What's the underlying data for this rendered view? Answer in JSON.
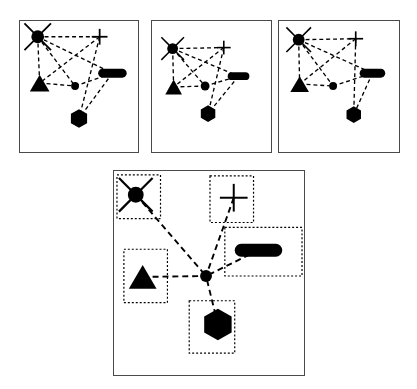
{
  "figure": {
    "background_color": "#ffffff",
    "ink_color": "#000000",
    "panel_border_color": "#4a4a4a",
    "edge_style": "dashed",
    "bbox_style": "dotted"
  },
  "legend": {
    "node_types": [
      {
        "key": "starburst",
        "label": "starburst",
        "icon": "starburst-icon"
      },
      {
        "key": "plus",
        "label": "plus",
        "icon": "plus-icon"
      },
      {
        "key": "pill",
        "label": "pill",
        "icon": "pill-icon"
      },
      {
        "key": "triangle",
        "label": "triangle",
        "icon": "triangle-icon"
      },
      {
        "key": "hexagon",
        "label": "hexagon",
        "icon": "hexagon-icon"
      },
      {
        "key": "dot",
        "label": "dot",
        "icon": "dot-icon"
      }
    ]
  },
  "panels": [
    {
      "id": "panel-1",
      "label": "Panel 1",
      "rect": {
        "x": 19,
        "y": 20,
        "w": 120,
        "h": 133
      },
      "viewbox": {
        "w": 120,
        "h": 133
      },
      "show_bboxes": false,
      "nodes": [
        {
          "id": "starburst",
          "shape": "starburst",
          "x": 18,
          "y": 16,
          "r": 6.5,
          "spike": 7
        },
        {
          "id": "plus",
          "shape": "plus",
          "x": 81,
          "y": 16,
          "r": 8,
          "thick": 1.8
        },
        {
          "id": "pill",
          "shape": "pill",
          "x": 94,
          "y": 53,
          "w": 29,
          "h": 9
        },
        {
          "id": "triangle",
          "shape": "triangle",
          "x": 20,
          "y": 63,
          "w": 20,
          "h": 17
        },
        {
          "id": "dot",
          "shape": "dot",
          "x": 56,
          "y": 66,
          "r": 4
        },
        {
          "id": "hexagon",
          "shape": "hexagon",
          "x": 60,
          "y": 99,
          "r": 9.5
        }
      ],
      "edges": [
        [
          "starburst",
          "plus"
        ],
        [
          "starburst",
          "triangle"
        ],
        [
          "starburst",
          "pill"
        ],
        [
          "starburst",
          "dot"
        ],
        [
          "plus",
          "triangle"
        ],
        [
          "plus",
          "hexagon"
        ],
        [
          "triangle",
          "dot"
        ],
        [
          "dot",
          "pill"
        ],
        [
          "pill",
          "hexagon"
        ]
      ]
    },
    {
      "id": "panel-2",
      "label": "Panel 2",
      "rect": {
        "x": 151,
        "y": 20,
        "w": 121,
        "h": 133
      },
      "viewbox": {
        "w": 121,
        "h": 133
      },
      "show_bboxes": false,
      "nodes": [
        {
          "id": "starburst",
          "shape": "starburst",
          "x": 21,
          "y": 28,
          "r": 5.5,
          "spike": 6
        },
        {
          "id": "plus",
          "shape": "plus",
          "x": 73,
          "y": 27,
          "r": 7,
          "thick": 1.6
        },
        {
          "id": "pill",
          "shape": "pill",
          "x": 88,
          "y": 56,
          "w": 22,
          "h": 8
        },
        {
          "id": "triangle",
          "shape": "triangle",
          "x": 22,
          "y": 67,
          "w": 17,
          "h": 15
        },
        {
          "id": "dot",
          "shape": "dot",
          "x": 54,
          "y": 66,
          "r": 4.5
        },
        {
          "id": "hexagon",
          "shape": "hexagon",
          "x": 57,
          "y": 94,
          "r": 8.5
        }
      ],
      "edges": [
        [
          "starburst",
          "plus"
        ],
        [
          "starburst",
          "triangle"
        ],
        [
          "starburst",
          "pill"
        ],
        [
          "starburst",
          "dot"
        ],
        [
          "plus",
          "triangle"
        ],
        [
          "plus",
          "hexagon"
        ],
        [
          "triangle",
          "dot"
        ],
        [
          "dot",
          "pill"
        ],
        [
          "pill",
          "hexagon"
        ]
      ]
    },
    {
      "id": "panel-3",
      "label": "Panel 3",
      "rect": {
        "x": 278,
        "y": 20,
        "w": 122,
        "h": 133
      },
      "viewbox": {
        "w": 122,
        "h": 133
      },
      "show_bboxes": false,
      "nodes": [
        {
          "id": "starburst",
          "shape": "starburst",
          "x": 20,
          "y": 19,
          "r": 6,
          "spike": 6.5
        },
        {
          "id": "plus",
          "shape": "plus",
          "x": 78,
          "y": 18,
          "r": 7.5,
          "thick": 1.7
        },
        {
          "id": "pill",
          "shape": "pill",
          "x": 95,
          "y": 53,
          "w": 26,
          "h": 9
        },
        {
          "id": "triangle",
          "shape": "triangle",
          "x": 21,
          "y": 64,
          "w": 19,
          "h": 16
        },
        {
          "id": "dot",
          "shape": "dot",
          "x": 55,
          "y": 66,
          "r": 4
        },
        {
          "id": "hexagon",
          "shape": "hexagon",
          "x": 76,
          "y": 95,
          "r": 8.5
        }
      ],
      "edges": [
        [
          "starburst",
          "plus"
        ],
        [
          "starburst",
          "triangle"
        ],
        [
          "starburst",
          "pill"
        ],
        [
          "starburst",
          "dot"
        ],
        [
          "plus",
          "triangle"
        ],
        [
          "plus",
          "hexagon"
        ],
        [
          "triangle",
          "dot"
        ],
        [
          "dot",
          "pill"
        ],
        [
          "pill",
          "hexagon"
        ]
      ]
    },
    {
      "id": "panel-4",
      "label": "Panel 4 (enlarged, with bounding boxes)",
      "rect": {
        "x": 113,
        "y": 170,
        "w": 192,
        "h": 206
      },
      "viewbox": {
        "w": 192,
        "h": 206
      },
      "show_bboxes": true,
      "nodes": [
        {
          "id": "starburst",
          "shape": "starburst",
          "x": 22,
          "y": 24,
          "r": 8,
          "spike": 9,
          "bbox": {
            "x": 3,
            "y": 4,
            "w": 44,
            "h": 44
          }
        },
        {
          "id": "plus",
          "shape": "plus",
          "x": 121,
          "y": 27,
          "r": 14,
          "thick": 2,
          "bbox": {
            "x": 97,
            "y": 5,
            "w": 44,
            "h": 47
          }
        },
        {
          "id": "pill",
          "shape": "pill",
          "x": 146,
          "y": 80,
          "w": 48,
          "h": 13,
          "bbox": {
            "x": 112,
            "y": 57,
            "w": 78,
            "h": 49
          }
        },
        {
          "id": "triangle",
          "shape": "triangle",
          "x": 29,
          "y": 107,
          "w": 28,
          "h": 24,
          "bbox": {
            "x": 10,
            "y": 79,
            "w": 44,
            "h": 54
          }
        },
        {
          "id": "dot",
          "shape": "dot",
          "x": 93,
          "y": 106,
          "r": 6
        },
        {
          "id": "hexagon",
          "shape": "hexagon",
          "x": 105,
          "y": 155,
          "r": 16,
          "bbox": {
            "x": 76,
            "y": 131,
            "w": 46,
            "h": 53
          }
        }
      ],
      "edges": [
        [
          "starburst",
          "dot"
        ],
        [
          "plus",
          "dot"
        ],
        [
          "pill",
          "dot"
        ],
        [
          "triangle",
          "dot"
        ],
        [
          "hexagon",
          "dot"
        ]
      ]
    }
  ]
}
